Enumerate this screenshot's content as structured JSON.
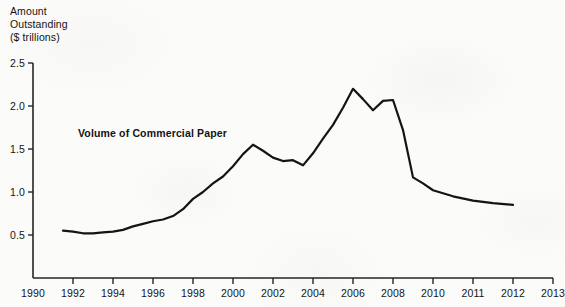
{
  "chart_data": {
    "type": "line",
    "title": "",
    "ylabel_lines": [
      "Amount",
      "Outstanding",
      "($ trillions)"
    ],
    "ylabel": "Amount Outstanding ($ trillions)",
    "xlabel": "",
    "annotation": "Volume of Commercial Paper",
    "series_name": "Volume of Commercial Paper",
    "line_color": "#141414",
    "axis_color": "#262626",
    "grid": false,
    "legend": "none",
    "xlim": [
      1990,
      2013
    ],
    "ylim": [
      0,
      2.5
    ],
    "ytick_labels": [
      "0.5",
      "1.0",
      "1.5",
      "2.0",
      "2.5"
    ],
    "ytick_values": [
      0.5,
      1.0,
      1.5,
      2.0,
      2.5
    ],
    "xtick_labels": [
      "1990",
      "1992",
      "1994",
      "1996",
      "1998",
      "2000",
      "2002",
      "2004",
      "2006",
      "2008",
      "2010",
      "2011",
      "2012",
      "2013"
    ],
    "xtick_values": [
      1990,
      1992,
      1994,
      1996,
      1998,
      2000,
      2002,
      2004,
      2006,
      2008,
      2010,
      2011,
      2012,
      2013
    ],
    "x": [
      1991.5,
      1992.0,
      1992.5,
      1993.0,
      1993.5,
      1994.0,
      1994.5,
      1995.0,
      1995.5,
      1996.0,
      1996.5,
      1997.0,
      1997.5,
      1998.0,
      1998.5,
      1999.0,
      1999.5,
      2000.0,
      2000.5,
      2001.0,
      2001.5,
      2002.0,
      2002.5,
      2003.0,
      2003.5,
      2004.0,
      2004.5,
      2005.0,
      2005.5,
      2006.0,
      2006.5,
      2007.0,
      2007.5,
      2008.0,
      2008.5,
      2009.0,
      2009.5,
      2010.0,
      2010.5,
      2011.0,
      2011.5,
      2012.0
    ],
    "values": [
      0.55,
      0.54,
      0.52,
      0.52,
      0.53,
      0.54,
      0.56,
      0.6,
      0.63,
      0.66,
      0.68,
      0.72,
      0.8,
      0.92,
      1.0,
      1.1,
      1.18,
      1.3,
      1.44,
      1.55,
      1.48,
      1.4,
      1.36,
      1.37,
      1.31,
      1.45,
      1.62,
      1.78,
      1.98,
      2.2,
      2.08,
      1.95,
      2.06,
      2.07,
      1.72,
      1.17,
      1.1,
      1.02,
      0.95,
      0.9,
      0.87,
      0.85
    ],
    "series": [
      {
        "name": "Volume of Commercial Paper",
        "values": [
          0.55,
          0.54,
          0.52,
          0.52,
          0.53,
          0.54,
          0.56,
          0.6,
          0.63,
          0.66,
          0.68,
          0.72,
          0.8,
          0.92,
          1.0,
          1.1,
          1.18,
          1.3,
          1.44,
          1.55,
          1.48,
          1.4,
          1.36,
          1.37,
          1.31,
          1.45,
          1.62,
          1.78,
          1.98,
          2.2,
          2.08,
          1.95,
          2.06,
          2.07,
          1.72,
          1.17,
          1.1,
          1.02,
          0.95,
          0.9,
          0.87,
          0.85
        ]
      }
    ]
  }
}
